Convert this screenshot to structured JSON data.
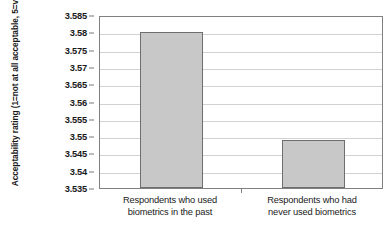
{
  "chart_data": {
    "type": "bar",
    "title": "",
    "xlabel": "",
    "ylabel": "Acceptability rating (1=not at all acceptable, 5=very acceptable)",
    "categories": [
      "Respondents who used biometrics in the past",
      "Respondents who had never used biometrics"
    ],
    "category_lines": [
      [
        "Respondents who used",
        "biometrics in the past"
      ],
      [
        "Respondents who had",
        "never used biometrics"
      ]
    ],
    "values": [
      3.58,
      3.549
    ],
    "ylim": [
      3.535,
      3.585
    ],
    "ytick_step": 0.005,
    "yticks": [
      "3.585",
      "3.58",
      "3.575",
      "3.57",
      "3.565",
      "3.56",
      "3.555",
      "3.55",
      "3.545",
      "3.54",
      "3.535"
    ],
    "ytick_values": [
      3.585,
      3.58,
      3.575,
      3.57,
      3.565,
      3.56,
      3.555,
      3.55,
      3.545,
      3.54,
      3.535
    ],
    "grid": true,
    "grid_orientation": "horizontal",
    "legend": "none",
    "bar_fill_color": "#c8c8c8",
    "bar_border_color": "#6e6e6e",
    "grid_color": "#d2d2d2",
    "axis_color": "#808080",
    "background_color": "#ffffff"
  }
}
